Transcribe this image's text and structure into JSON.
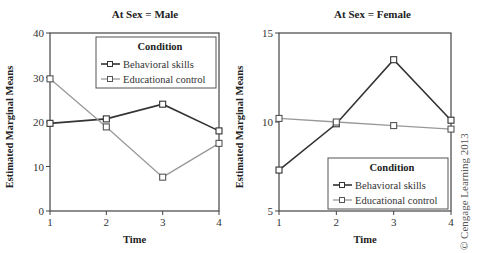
{
  "chart_data": [
    {
      "type": "line",
      "title": "At Sex = Male",
      "xlabel": "Time",
      "ylabel": "Estimated Marginal Means",
      "x": [
        1,
        2,
        3,
        4
      ],
      "xticks": [
        "1",
        "2",
        "3",
        "4"
      ],
      "yticks": [
        "0",
        "10",
        "20",
        "30",
        "40"
      ],
      "ylim": [
        0,
        40
      ],
      "grid": false,
      "legend": {
        "title": "Condition",
        "position": "upper right"
      },
      "series": [
        {
          "name": "Behavioral skills",
          "color": "#333333",
          "values": [
            19.7,
            20.7,
            24.0,
            18.0
          ]
        },
        {
          "name": "Educational control",
          "color": "#999999",
          "values": [
            29.7,
            18.9,
            7.6,
            15.2
          ]
        }
      ]
    },
    {
      "type": "line",
      "title": "At Sex = Female",
      "xlabel": "Time",
      "ylabel": "Estimated Marginal Means",
      "x": [
        1,
        2,
        3,
        4
      ],
      "xticks": [
        "1",
        "2",
        "3",
        "4"
      ],
      "yticks": [
        "5",
        "10",
        "15"
      ],
      "ylim": [
        5,
        15
      ],
      "grid": false,
      "legend": {
        "title": "Condition",
        "position": "lower right"
      },
      "series": [
        {
          "name": "Behavioral skills",
          "color": "#333333",
          "values": [
            7.3,
            9.9,
            13.5,
            10.1
          ]
        },
        {
          "name": "Educational control",
          "color": "#999999",
          "values": [
            10.2,
            10.0,
            9.8,
            9.6
          ]
        }
      ]
    }
  ],
  "copyright": "© Cengage Learning 2013"
}
